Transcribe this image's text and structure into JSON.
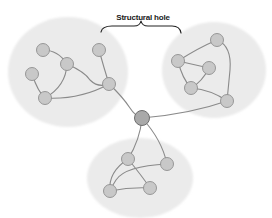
{
  "diagram": {
    "annotation": {
      "label": "Structural hole",
      "x": 143,
      "y": 13
    },
    "colors": {
      "cluster_fill": "#ebebeb",
      "node_fill": "#c8c8c8",
      "node_stroke": "#8e8e8e",
      "broker_fill": "#a9a9a9",
      "broker_stroke": "#6e6e6e",
      "edge": "#8a8a8a",
      "brace": "#222222"
    },
    "clusters": [
      {
        "id": "left",
        "cx": 68,
        "cy": 72,
        "rx": 60,
        "ry": 55
      },
      {
        "id": "right",
        "cx": 214,
        "cy": 70,
        "rx": 52,
        "ry": 48
      },
      {
        "id": "bottom",
        "cx": 140,
        "cy": 178,
        "rx": 53,
        "ry": 40
      }
    ],
    "broker": {
      "id": "broker",
      "x": 142,
      "y": 118,
      "r": 7.5
    },
    "nodes": [
      {
        "id": "L1",
        "x": 43,
        "y": 50
      },
      {
        "id": "L2",
        "x": 67,
        "y": 64
      },
      {
        "id": "L3",
        "x": 32,
        "y": 74
      },
      {
        "id": "L4",
        "x": 45,
        "y": 98
      },
      {
        "id": "L5",
        "x": 99,
        "y": 50
      },
      {
        "id": "L6",
        "x": 109,
        "y": 84
      },
      {
        "id": "R1",
        "x": 217,
        "y": 40
      },
      {
        "id": "R2",
        "x": 178,
        "y": 61
      },
      {
        "id": "R3",
        "x": 209,
        "y": 68
      },
      {
        "id": "R4",
        "x": 191,
        "y": 88
      },
      {
        "id": "R5",
        "x": 227,
        "y": 101
      },
      {
        "id": "B1",
        "x": 128,
        "y": 159
      },
      {
        "id": "B2",
        "x": 167,
        "y": 164
      },
      {
        "id": "B3",
        "x": 110,
        "y": 191
      },
      {
        "id": "B4",
        "x": 150,
        "y": 188
      }
    ],
    "edges": [
      {
        "d": "M43,50 Q58,50 67,64"
      },
      {
        "d": "M67,64 Q66,86 45,98"
      },
      {
        "d": "M32,74 Q38,92 45,98"
      },
      {
        "d": "M67,64 Q85,72 90,80 Q98,88 109,84"
      },
      {
        "d": "M99,50 Q104,68 109,84"
      },
      {
        "d": "M45,98 Q80,100 109,84"
      },
      {
        "d": "M109,84 Q122,96 130,108 Q135,116 142,118"
      },
      {
        "d": "M142,118 Q190,114 227,101"
      },
      {
        "d": "M178,61 Q198,48 217,40"
      },
      {
        "d": "M178,61 L209,68"
      },
      {
        "d": "M178,61 Q182,78 191,88"
      },
      {
        "d": "M209,68 Q202,82 191,88"
      },
      {
        "d": "M191,88 Q212,90 227,101"
      },
      {
        "d": "M217,40 Q232,46 230,70 L227,101"
      },
      {
        "d": "M142,118 Q140,140 128,159"
      },
      {
        "d": "M142,118 Q162,140 167,164"
      },
      {
        "d": "M128,159 Q108,172 110,191"
      },
      {
        "d": "M128,159 Q142,176 150,188"
      },
      {
        "d": "M167,164 Q125,166 116,180 Q112,186 110,191"
      },
      {
        "d": "M110,191 Q130,187 150,188"
      }
    ],
    "brace": {
      "d": "M101,32 Q102,26 112,26 L134,26 Q140,26 141,21 Q142,26 148,26 L172,26 Q180,26 181,33"
    }
  }
}
